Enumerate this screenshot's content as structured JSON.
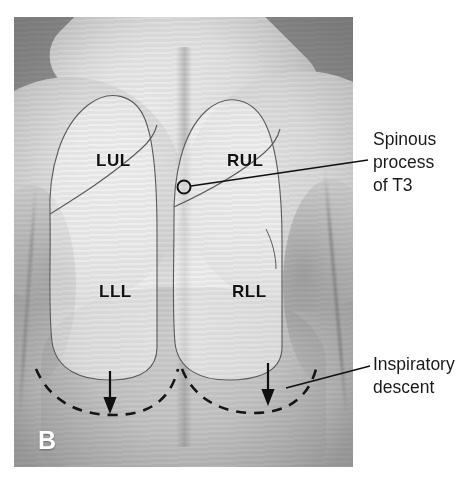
{
  "figure": {
    "panel_letter": "B",
    "lobe_labels": [
      {
        "id": "lul",
        "text": "LUL",
        "meaning": "left-upper-lobe"
      },
      {
        "id": "rul",
        "text": "RUL",
        "meaning": "right-upper-lobe"
      },
      {
        "id": "lll",
        "text": "LLL",
        "meaning": "left-lower-lobe"
      },
      {
        "id": "rll",
        "text": "RLL",
        "meaning": "right-lower-lobe"
      }
    ],
    "callouts": [
      {
        "id": "spinous",
        "lines": [
          "Spinous",
          "process",
          "of T3"
        ],
        "line1": "Spinous",
        "line2": "process",
        "line3": "of T3",
        "marker": "circle"
      },
      {
        "id": "descent",
        "lines": [
          "Inspiratory",
          "descent"
        ],
        "line1": "Inspiratory",
        "line2": "descent",
        "marker": "none"
      }
    ],
    "colors": {
      "ink": "#1a1a1a",
      "label_ink": "#111111",
      "panel_letter_ink": "#ffffff",
      "page_background": "#ffffff",
      "photo_midtone": "#c2c2c2"
    }
  }
}
